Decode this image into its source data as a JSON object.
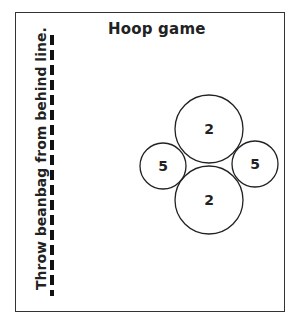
{
  "title": "Hoop game",
  "side_label": "Throw beanbag from behind line.",
  "throw_line": {
    "style": "dashed",
    "x": 52,
    "y_start": 35,
    "y_end": 296
  },
  "hoops": [
    {
      "id": "top",
      "points": "2",
      "cx": 209,
      "cy": 129,
      "r": 34
    },
    {
      "id": "bottom",
      "points": "2",
      "cx": 209,
      "cy": 200,
      "r": 34
    },
    {
      "id": "left",
      "points": "5",
      "cx": 163,
      "cy": 166,
      "r": 23
    },
    {
      "id": "right",
      "points": "5",
      "cx": 255,
      "cy": 164,
      "r": 23
    }
  ]
}
